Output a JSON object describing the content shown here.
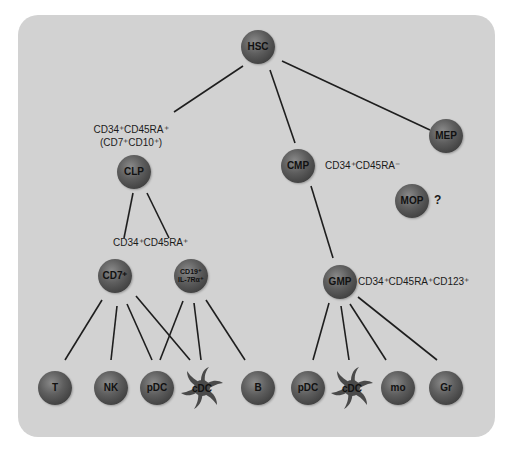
{
  "nodes": {
    "hsc": "HSC",
    "clp": "CLP",
    "cmp": "CMP",
    "mep": "MEP",
    "mop": "MOP",
    "cd7": "CD7⁺",
    "cd19_line1": "CD19⁺",
    "cd19_line2": "IL-7Rα⁺",
    "gmp": "GMP",
    "t": "T",
    "nk": "NK",
    "pdc_lymphoid": "pDC",
    "cdc_lymphoid": "cDC",
    "b": "B",
    "pdc_myeloid": "pDC",
    "cdc_myeloid": "cDC",
    "mo": "mo",
    "gr": "Gr"
  },
  "labels": {
    "clp_marker_line1": "CD34⁺CD45RA⁺",
    "clp_marker_line2": "(CD7⁺CD10⁺)",
    "cmp_marker": "CD34⁺CD45RA⁻",
    "lymphoid_branch_marker": "CD34⁺CD45RA⁺",
    "gmp_marker": "CD34⁺CD45RA⁺CD123⁺",
    "mop_question": "?"
  },
  "colors": {
    "panel_background": "#d2d2d2",
    "node_fill": "#5e5e5e",
    "edge": "#1e1e1e"
  }
}
